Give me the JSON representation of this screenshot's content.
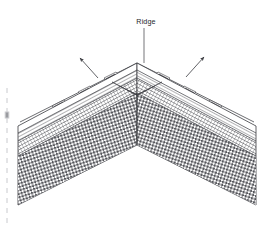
{
  "figure": {
    "kind": "technical-line-drawing",
    "view": "isometric-perspective",
    "background_color": "#ffffff",
    "line_color": "#3a3b40",
    "hatch_color": "#4a4b50",
    "label_color": "#26272b",
    "width_px": 266,
    "height_px": 235
  },
  "annotations": {
    "ridge": {
      "label": "Ridge",
      "label_x": 146,
      "label_y": 24,
      "leader_from_x": 144,
      "leader_from_y": 27,
      "leader_to_x": 144,
      "leader_to_y": 63
    },
    "arrows": [
      {
        "name": "left-ridge-arrow",
        "tail_x": 98,
        "tail_y": 78,
        "head_x": 79,
        "head_y": 57,
        "direction": "up-left"
      },
      {
        "name": "right-ridge-arrow",
        "tail_x": 186,
        "tail_y": 77,
        "head_x": 205,
        "head_y": 56,
        "direction": "up-right"
      }
    ]
  },
  "geometry": {
    "apex_x": 137,
    "ridge_top_y": 63,
    "left_end_x": 18,
    "right_end_x": 256,
    "ridge_left_end_y": 126,
    "ridge_right_end_y": 126,
    "valley_apex_y": 145,
    "bottom_left_y": 205,
    "bottom_right_y": 205
  },
  "layers": [
    {
      "name": "ridge-cap-boards",
      "description": "Ridge cap boards and battens at apex",
      "pattern": "parallel-lines"
    },
    {
      "name": "ridge-clips",
      "description": "Mechanical ridge fixing clips",
      "pattern": "solid-blocks",
      "count": 6
    },
    {
      "name": "tile-battens",
      "description": "Upper roof slope with tile battens",
      "pattern": "fine-diagonal-hatch"
    },
    {
      "name": "membrane-layer",
      "description": "Underlay membrane band",
      "pattern": "dense-cross-hatch"
    },
    {
      "name": "deck-insulation",
      "description": "Roof deck / insulation body",
      "pattern": "checker-grid"
    }
  ],
  "margin_marks": {
    "name": "page-edge-tick-marks",
    "side": "left",
    "count": 14,
    "color": "#c9cace"
  }
}
